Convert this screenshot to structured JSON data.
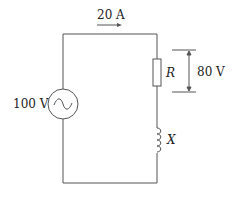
{
  "diagram": {
    "type": "AC series RL circuit",
    "current_label": "20 A",
    "source_label": "100 V",
    "resistor_label": "R",
    "resistor_voltage_label": "80 V",
    "inductor_label": "X",
    "colors": {
      "wire": "#555555",
      "text": "#222222"
    }
  }
}
